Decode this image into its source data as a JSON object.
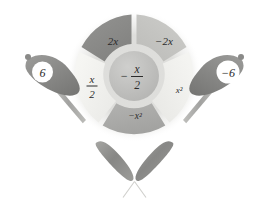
{
  "figure": {
    "background_color": "#ffffff"
  },
  "wheel": {
    "center_hub": {
      "label": "-x/2",
      "numerator": "x",
      "denominator": "2",
      "sign": "−",
      "color": "#bdbdbb"
    },
    "segments": [
      {
        "name": "top-left",
        "label": "2x",
        "color": "#8c8c8a"
      },
      {
        "name": "top-right",
        "label": "−2x",
        "color": "#c6c6c3"
      },
      {
        "name": "right",
        "label": "x²",
        "color": "#f1f1ee"
      },
      {
        "name": "bottom",
        "label": "−x²",
        "color": "#aaaaa8"
      },
      {
        "name": "left",
        "label": "x/2",
        "numerator": "x",
        "denominator": "2",
        "color": "#f4f4f1"
      }
    ],
    "halo_color": "#e6e6e3"
  },
  "paddles": [
    {
      "name": "left-paddle",
      "label": "6",
      "body_color": "#8e8e8c",
      "handle_color": "#a9a9a6"
    },
    {
      "name": "right-paddle",
      "label": "−6",
      "body_color": "#8e8e8c",
      "handle_color": "#a9a9a6"
    },
    {
      "name": "bottom-left-paddle",
      "label": "",
      "body_color": "#8d8d8a",
      "handle_color": "#b5b5b2"
    },
    {
      "name": "bottom-right-paddle",
      "label": "",
      "body_color": "#8d8d8a",
      "handle_color": "#b5b5b2"
    }
  ]
}
